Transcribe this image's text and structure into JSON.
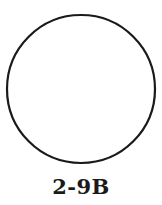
{
  "figure": {
    "shape": "circle",
    "stroke_color": "#1a1a1a",
    "fill_color": "#ffffff",
    "caption": "2-9B"
  }
}
